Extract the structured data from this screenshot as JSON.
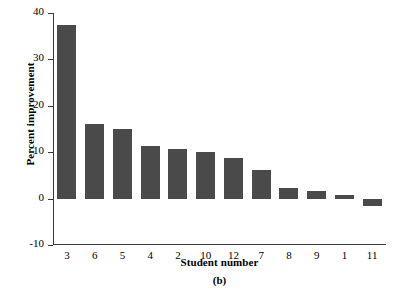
{
  "chart_data": {
    "type": "bar",
    "title": "",
    "panel_label": "(b)",
    "xlabel": "Student number",
    "ylabel": "Percent improvement",
    "categories": [
      "3",
      "6",
      "5",
      "4",
      "2",
      "10",
      "12",
      "7",
      "8",
      "9",
      "1",
      "11"
    ],
    "values": [
      37.5,
      16.0,
      15.0,
      11.3,
      10.7,
      10.0,
      8.8,
      6.2,
      2.2,
      1.6,
      0.7,
      -1.5
    ],
    "ylim": [
      -10,
      40
    ],
    "yticks": [
      40,
      30,
      20,
      10,
      0,
      -10
    ],
    "ytick_labels": [
      "40",
      "30",
      "20",
      "10",
      "0",
      "-10"
    ],
    "grid": false,
    "legend": null,
    "bar_color": "#4a4a4a",
    "axis_color": "#3a3a3a",
    "background": "#ffffff"
  }
}
